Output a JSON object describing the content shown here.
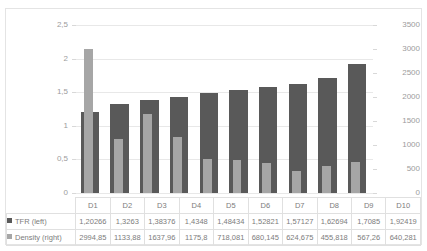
{
  "clipped_title": "",
  "legend": {
    "tfr": {
      "label": "TFR (left)",
      "color": "#595959",
      "marker": "square-marker-icon"
    },
    "density": {
      "label": "Density (right)",
      "color": "#a6a6a6",
      "marker": "square-marker-icon"
    }
  },
  "axes": {
    "left_ticks": [
      "0",
      "0,5",
      "1",
      "1,5",
      "2",
      "2,5"
    ],
    "right_ticks": [
      "0",
      "500",
      "1000",
      "1500",
      "2000",
      "2500",
      "3000",
      "3500"
    ]
  },
  "table": {
    "row_header_tfr": "TFR (left)",
    "row_header_density": "Density (right)",
    "categories": [
      "D1",
      "D2",
      "D3",
      "D4",
      "D5",
      "D6",
      "D7",
      "D8",
      "D9",
      "D10"
    ],
    "tfr_text": [
      "1,20266",
      "1,3263",
      "1,38376",
      "1,4348",
      "1,48434",
      "1,52821",
      "1,57127",
      "1,62694",
      "1,7085",
      "1,92419"
    ],
    "density_text": [
      "2994,85",
      "1133,88",
      "1637,96",
      "1175,8",
      "718,081",
      "680,145",
      "624,675",
      "455,818",
      "567,26",
      "640,281"
    ]
  },
  "chart_data": {
    "type": "bar",
    "title": "",
    "xlabel": "",
    "grid": true,
    "legend_position": "bottom-table",
    "categories": [
      "D1",
      "D2",
      "D3",
      "D4",
      "D5",
      "D6",
      "D7",
      "D8",
      "D9",
      "D10"
    ],
    "series": [
      {
        "name": "TFR (left)",
        "axis": "left",
        "color": "#595959",
        "values": [
          1.20266,
          1.3263,
          1.38376,
          1.4348,
          1.48434,
          1.52821,
          1.57127,
          1.62694,
          1.7085,
          1.92419
        ]
      },
      {
        "name": "Density (right)",
        "axis": "right",
        "color": "#a6a6a6",
        "values": [
          2994.85,
          1133.88,
          1637.96,
          1175.8,
          718.081,
          680.145,
          624.675,
          455.818,
          567.26,
          640.281
        ]
      }
    ],
    "ylabel": "",
    "ylim": [
      0,
      2.5
    ],
    "y2label": "",
    "y2lim": [
      0,
      3500
    ],
    "ytick_step": 0.5,
    "y2tick_step": 500
  }
}
